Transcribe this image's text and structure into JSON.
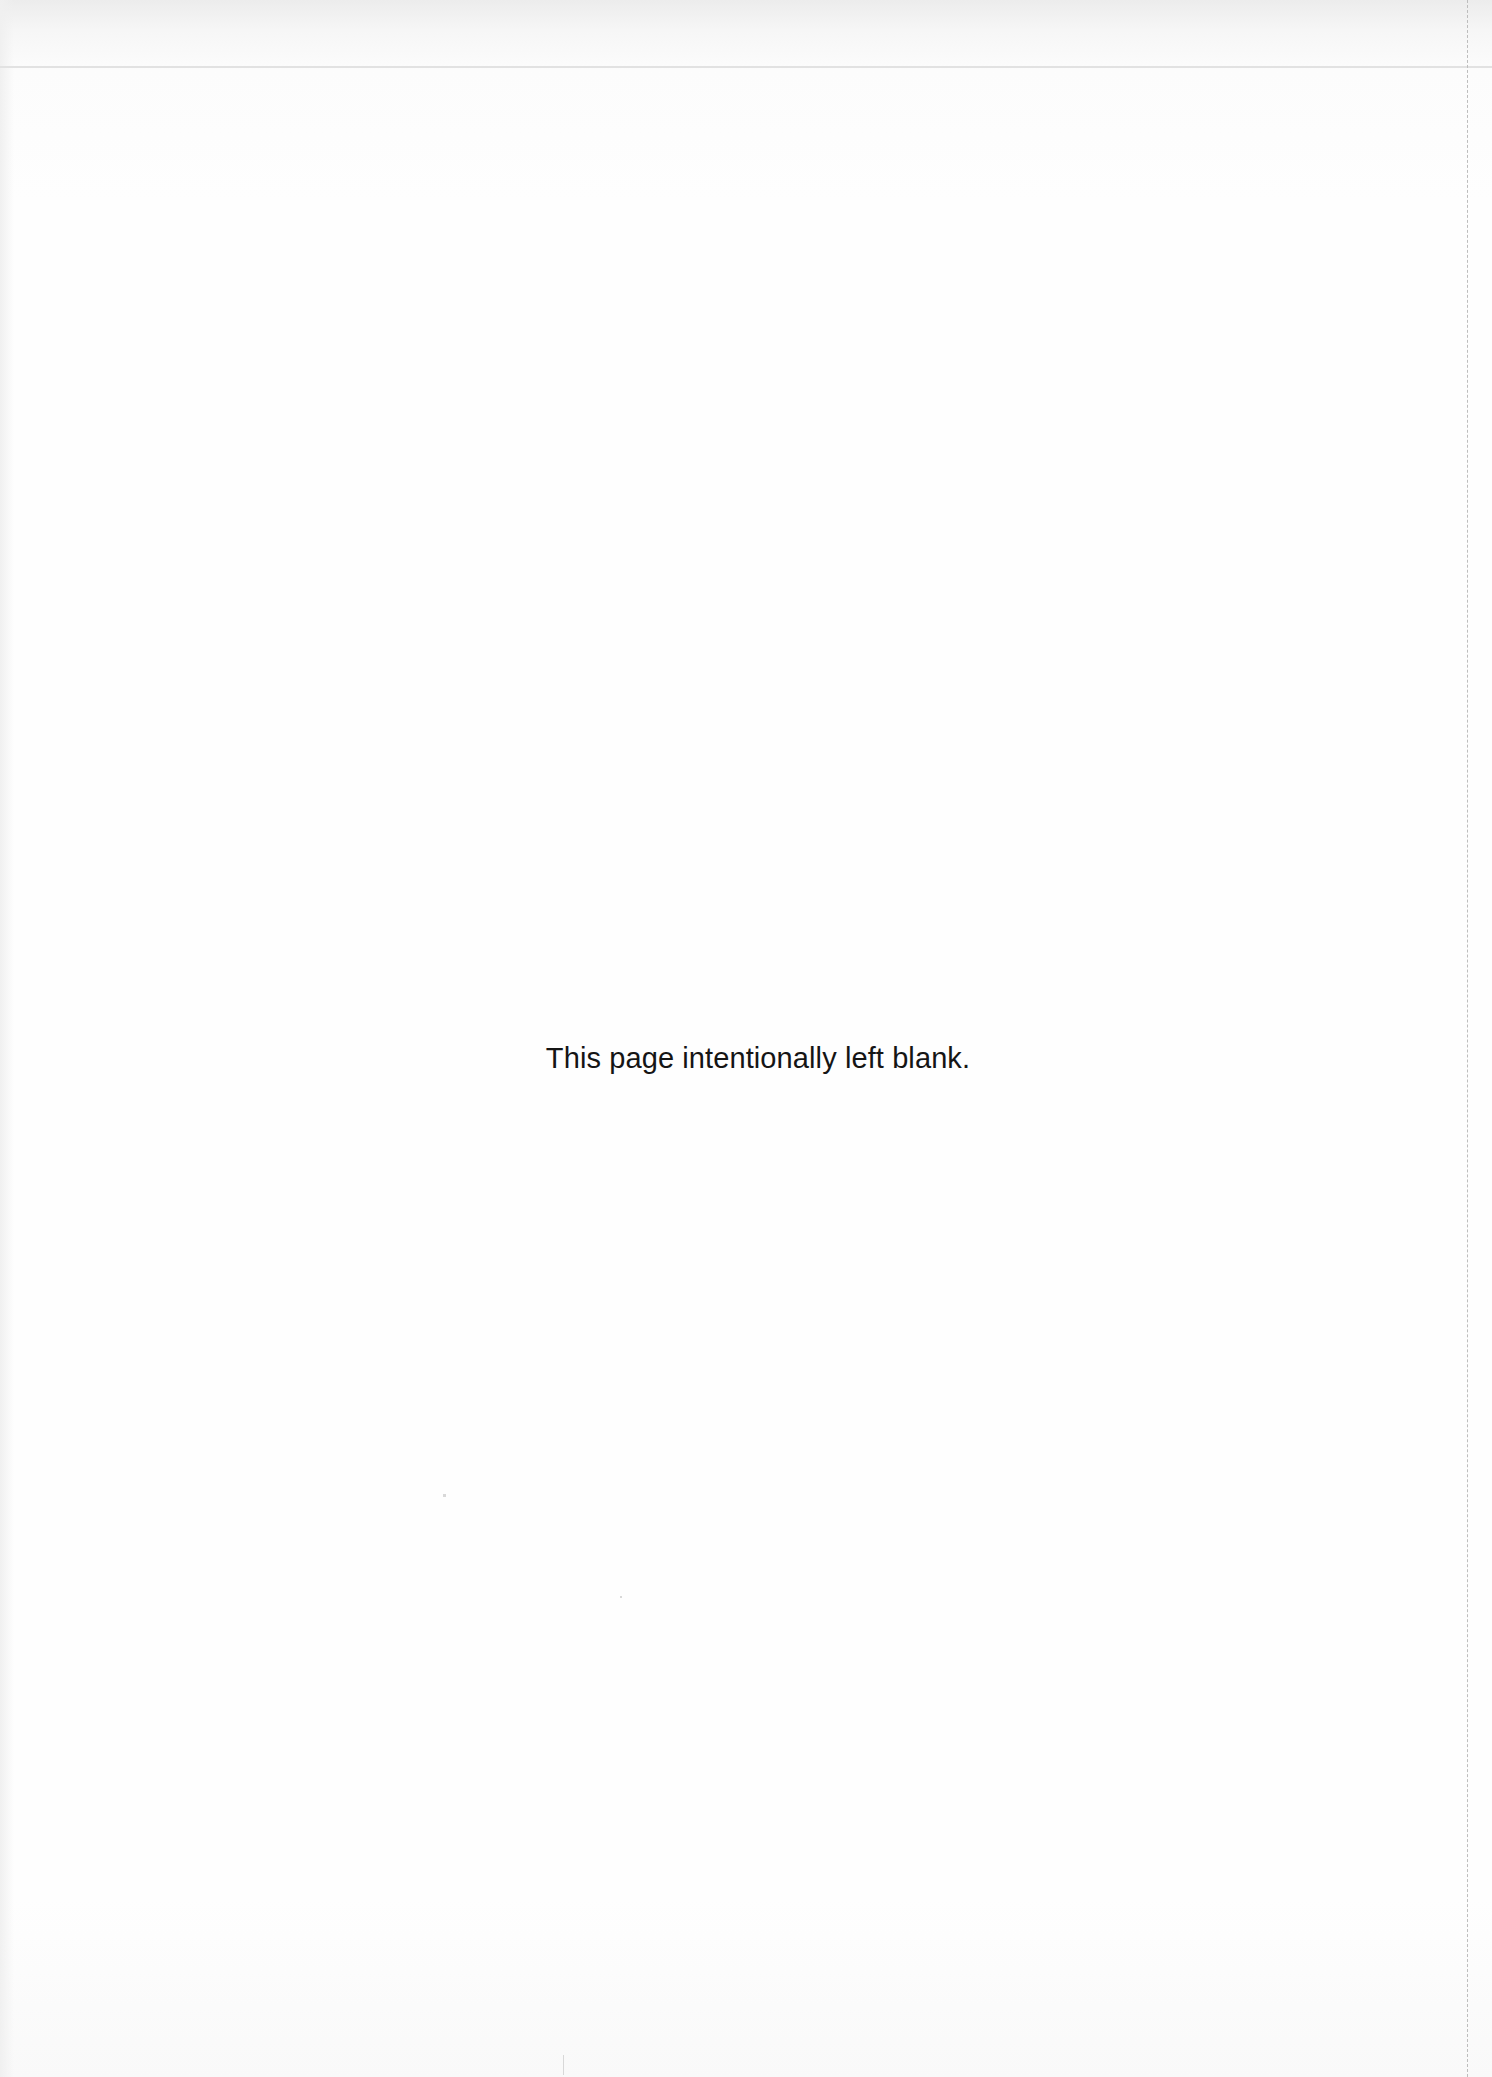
{
  "page": {
    "notice": "This page intentionally left blank."
  }
}
